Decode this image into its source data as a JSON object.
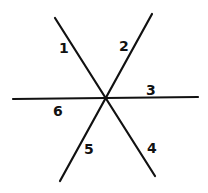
{
  "diagram": {
    "stroke_color": "#111111",
    "background": "#ffffff",
    "lines": [
      {
        "id": "line-a",
        "x1": 55,
        "y1": 18,
        "x2": 155,
        "y2": 176
      },
      {
        "id": "line-b",
        "x1": 152,
        "y1": 14,
        "x2": 60,
        "y2": 181
      },
      {
        "id": "line-c",
        "x1": 13,
        "y1": 99,
        "x2": 198,
        "y2": 97
      }
    ],
    "labels": [
      {
        "text": "1",
        "x": 59,
        "y": 41
      },
      {
        "text": "2",
        "x": 119,
        "y": 39
      },
      {
        "text": "3",
        "x": 146,
        "y": 83
      },
      {
        "text": "4",
        "x": 147,
        "y": 141
      },
      {
        "text": "5",
        "x": 84,
        "y": 142
      },
      {
        "text": "6",
        "x": 53,
        "y": 104
      }
    ]
  }
}
